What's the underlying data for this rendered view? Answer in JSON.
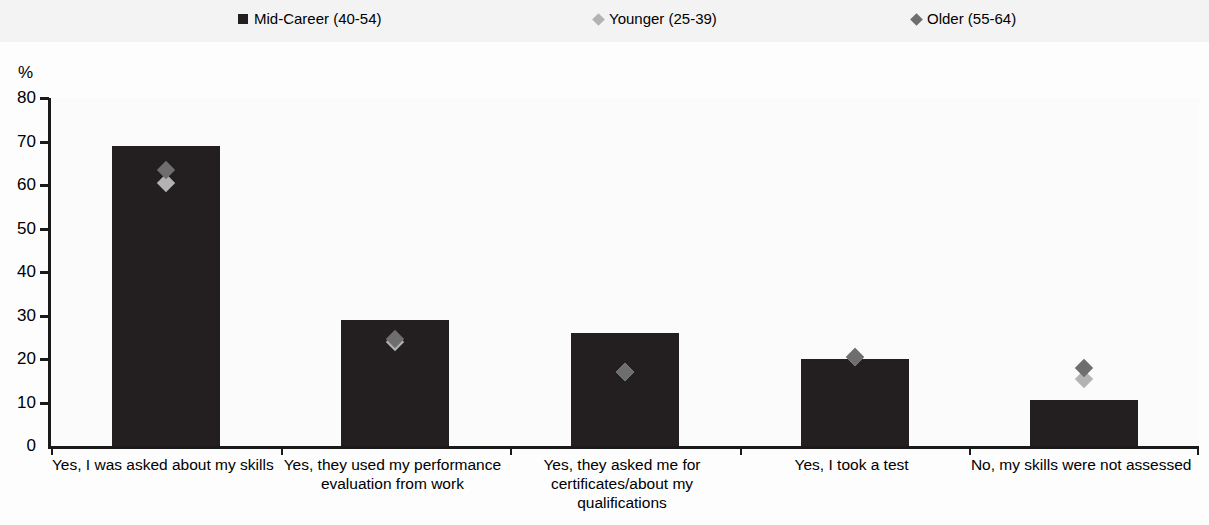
{
  "axis": {
    "unit_label": "%",
    "y_ticks": [
      "80",
      "70",
      "60",
      "50",
      "40",
      "30",
      "20",
      "10",
      "0"
    ]
  },
  "legend": {
    "items": [
      {
        "label": "Mid-Career (40-54)",
        "marker": "square-marker-icon",
        "color": "#231f20"
      },
      {
        "label": "Younger (25-39)",
        "marker": "diamond-marker-icon",
        "color": "#b3b3b3"
      },
      {
        "label": "Older (55-64)",
        "marker": "diamond-marker-icon",
        "color": "#6e6e6e"
      }
    ]
  },
  "chart_data": {
    "type": "bar",
    "title": "",
    "xlabel": "",
    "ylabel": "%",
    "ylim": [
      0,
      80
    ],
    "ytick_step": 10,
    "grid": false,
    "legend_position": "top",
    "categories": [
      "Yes, I was asked about my skills",
      "Yes, they used my performance evaluation from work",
      "Yes, they asked me for certificates/about my qualifications",
      "Yes, I took a test",
      "No, my skills were not assessed"
    ],
    "series": [
      {
        "name": "Mid-Career (40-54)",
        "type": "bar",
        "color": "#231f20",
        "values": [
          69,
          29,
          26,
          20,
          10.5
        ]
      },
      {
        "name": "Younger (25-39)",
        "type": "marker",
        "marker": "diamond",
        "color": "#b3b3b3",
        "values": [
          62,
          25.5,
          18.5,
          22,
          17
        ]
      },
      {
        "name": "Older (55-64)",
        "type": "marker",
        "marker": "diamond",
        "color": "#6e6e6e",
        "values": [
          65,
          26,
          18.5,
          22,
          19.5
        ]
      }
    ]
  }
}
